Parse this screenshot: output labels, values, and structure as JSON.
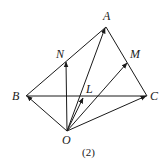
{
  "figure": {
    "caption": "(2)",
    "points": {
      "A": {
        "label": "A",
        "x": 106,
        "y": 27
      },
      "B": {
        "label": "B",
        "x": 26,
        "y": 96
      },
      "C": {
        "label": "C",
        "x": 147,
        "y": 96
      },
      "O": {
        "label": "O",
        "x": 67,
        "y": 131
      },
      "N": {
        "label": "N",
        "x": 66,
        "y": 62
      },
      "M": {
        "label": "M",
        "x": 128,
        "y": 62
      },
      "L": {
        "label": "L",
        "x": 84,
        "y": 96
      }
    },
    "segments": [
      [
        "A",
        "B"
      ],
      [
        "A",
        "C"
      ],
      [
        "B",
        "C"
      ]
    ],
    "vectors": [
      [
        "O",
        "B"
      ],
      [
        "O",
        "N"
      ],
      [
        "O",
        "L"
      ],
      [
        "O",
        "A"
      ],
      [
        "O",
        "M"
      ],
      [
        "O",
        "C"
      ]
    ]
  }
}
